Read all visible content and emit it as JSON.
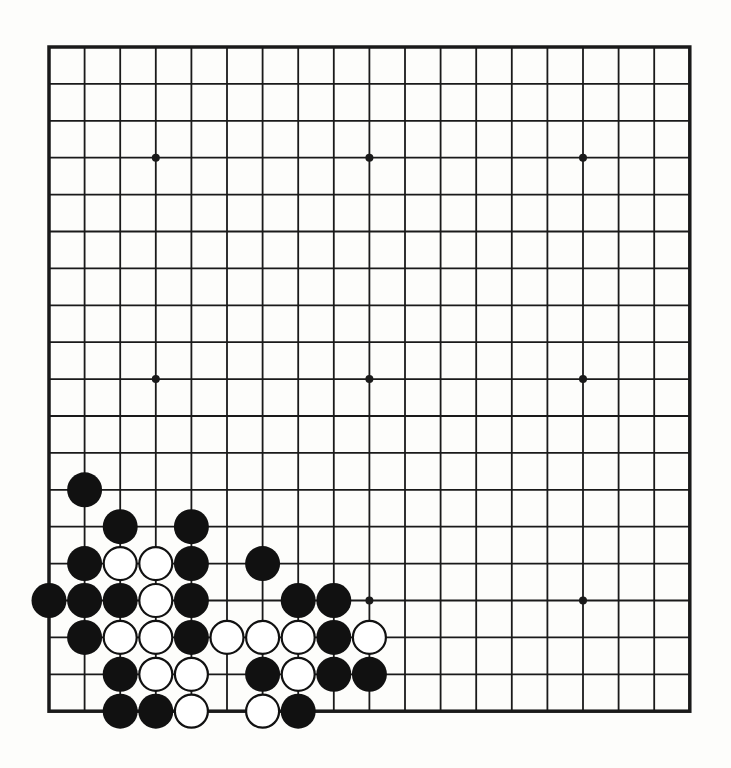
{
  "board": {
    "size": 19,
    "origin_x": 49,
    "origin_y": 47,
    "step_x": 35.6,
    "step_y": 36.9,
    "line_color": "#1a1a1a",
    "border_width": 3.5,
    "line_width": 1.8,
    "stone_radius": 17.5,
    "black_color": "#111111",
    "white_fill": "#ffffff",
    "white_stroke": "#111111",
    "star_points": [
      [
        3,
        3
      ],
      [
        9,
        3
      ],
      [
        15,
        3
      ],
      [
        3,
        9
      ],
      [
        9,
        9
      ],
      [
        15,
        9
      ],
      [
        3,
        15
      ],
      [
        9,
        15
      ],
      [
        15,
        15
      ]
    ]
  },
  "stones": [
    {
      "col": 1,
      "row": 12,
      "color": "black"
    },
    {
      "col": 2,
      "row": 13,
      "color": "black"
    },
    {
      "col": 4,
      "row": 13,
      "color": "black"
    },
    {
      "col": 1,
      "row": 14,
      "color": "black"
    },
    {
      "col": 2,
      "row": 14,
      "color": "white"
    },
    {
      "col": 3,
      "row": 14,
      "color": "white"
    },
    {
      "col": 4,
      "row": 14,
      "color": "black"
    },
    {
      "col": 6,
      "row": 14,
      "color": "black"
    },
    {
      "col": 0,
      "row": 15,
      "color": "black"
    },
    {
      "col": 1,
      "row": 15,
      "color": "black"
    },
    {
      "col": 2,
      "row": 15,
      "color": "black"
    },
    {
      "col": 3,
      "row": 15,
      "color": "white"
    },
    {
      "col": 4,
      "row": 15,
      "color": "black"
    },
    {
      "col": 7,
      "row": 15,
      "color": "black"
    },
    {
      "col": 8,
      "row": 15,
      "color": "black"
    },
    {
      "col": 1,
      "row": 16,
      "color": "black"
    },
    {
      "col": 2,
      "row": 16,
      "color": "white"
    },
    {
      "col": 3,
      "row": 16,
      "color": "white"
    },
    {
      "col": 4,
      "row": 16,
      "color": "black"
    },
    {
      "col": 5,
      "row": 16,
      "color": "white"
    },
    {
      "col": 6,
      "row": 16,
      "color": "white"
    },
    {
      "col": 7,
      "row": 16,
      "color": "white"
    },
    {
      "col": 8,
      "row": 16,
      "color": "black"
    },
    {
      "col": 9,
      "row": 16,
      "color": "white"
    },
    {
      "col": 2,
      "row": 17,
      "color": "black"
    },
    {
      "col": 3,
      "row": 17,
      "color": "white"
    },
    {
      "col": 4,
      "row": 17,
      "color": "white"
    },
    {
      "col": 6,
      "row": 17,
      "color": "black"
    },
    {
      "col": 7,
      "row": 17,
      "color": "white"
    },
    {
      "col": 8,
      "row": 17,
      "color": "black"
    },
    {
      "col": 9,
      "row": 17,
      "color": "black"
    },
    {
      "col": 2,
      "row": 18,
      "color": "black"
    },
    {
      "col": 3,
      "row": 18,
      "color": "black"
    },
    {
      "col": 4,
      "row": 18,
      "color": "white"
    },
    {
      "col": 6,
      "row": 18,
      "color": "white"
    },
    {
      "col": 7,
      "row": 18,
      "color": "black"
    }
  ]
}
